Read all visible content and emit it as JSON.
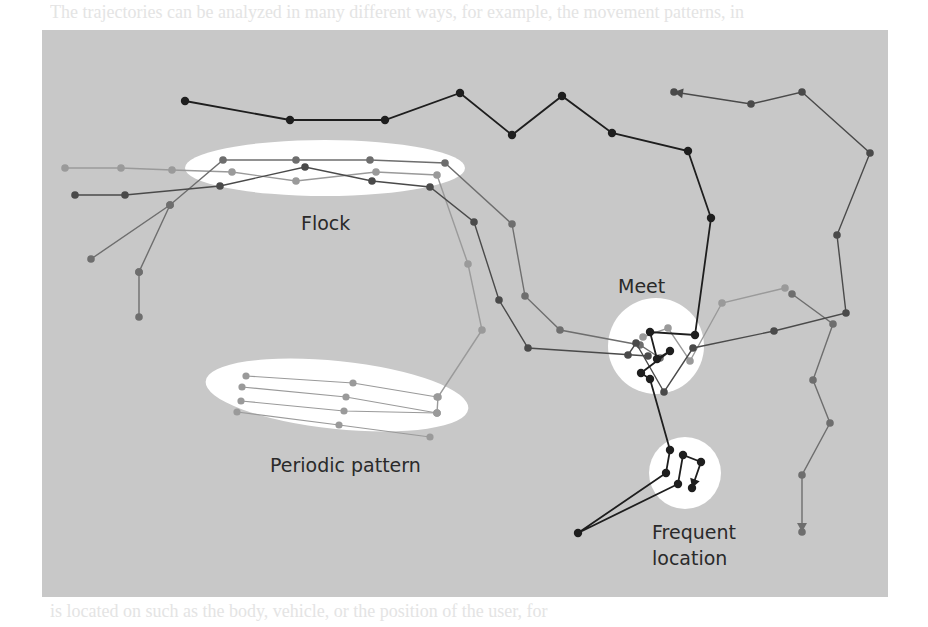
{
  "figure": {
    "panel_bg": "#c8c8c8",
    "highlight_color": "#ffffff",
    "colors": {
      "black": "#1e1e1e",
      "dark": "#4a4a4a",
      "mid": "#6e6e6e",
      "light": "#9a9a9a"
    }
  },
  "labels": {
    "flock": "Flock",
    "meet": "Meet",
    "periodic": "Periodic pattern",
    "frequent_line1": "Frequent",
    "frequent_line2": "location"
  },
  "bleed_text": {
    "top": "The trajectories can be analyzed in many different ways, for example, the movement patterns, in",
    "bottom": "is located on such as the body, vehicle, or the position of the user, for"
  },
  "regions": [
    {
      "name": "flock",
      "shape": "ellipse",
      "cx": 325,
      "cy": 168,
      "rx": 140,
      "ry": 28
    },
    {
      "name": "periodic",
      "shape": "ellipse",
      "cx": 337,
      "cy": 395,
      "rx": 132,
      "ry": 34,
      "rotate": 6
    },
    {
      "name": "meet",
      "shape": "circle",
      "cx": 656,
      "cy": 346,
      "r": 48
    },
    {
      "name": "frequent",
      "shape": "circle",
      "cx": 685,
      "cy": 473,
      "r": 36
    }
  ],
  "trajectories": [
    {
      "id": "black-top",
      "color": "black",
      "points": [
        [
          185,
          101
        ],
        [
          290,
          120
        ],
        [
          385,
          120
        ],
        [
          460,
          93
        ],
        [
          512,
          135
        ],
        [
          562,
          96
        ],
        [
          612,
          133
        ],
        [
          688,
          151
        ],
        [
          711,
          218
        ],
        [
          695,
          335
        ],
        [
          650,
          332
        ],
        [
          657,
          359
        ],
        [
          670,
          351
        ],
        [
          641,
          373
        ],
        [
          650,
          379
        ],
        [
          670,
          450
        ],
        [
          666,
          473
        ],
        [
          578,
          533
        ],
        [
          678,
          484
        ],
        [
          683,
          455
        ],
        [
          701,
          462
        ],
        [
          692,
          488
        ]
      ],
      "arrow_end": true
    },
    {
      "id": "gray-right-loop",
      "color": "dark",
      "points": [
        [
          674,
          92
        ],
        [
          751,
          104
        ],
        [
          802,
          92
        ],
        [
          870,
          153
        ],
        [
          837,
          235
        ],
        [
          846,
          313
        ],
        [
          774,
          331
        ],
        [
          693,
          348
        ],
        [
          664,
          392
        ],
        [
          636,
          343
        ],
        [
          628,
          355
        ]
      ],
      "arrow_start": true
    },
    {
      "id": "flock-dark",
      "color": "dark",
      "points": [
        [
          75,
          195
        ],
        [
          125,
          195
        ],
        [
          220,
          186
        ],
        [
          305,
          167
        ],
        [
          372,
          181
        ],
        [
          430,
          187
        ],
        [
          474,
          222
        ],
        [
          499,
          300
        ],
        [
          528,
          348
        ],
        [
          648,
          356
        ]
      ]
    },
    {
      "id": "flock-mid",
      "color": "mid",
      "points": [
        [
          91,
          259
        ],
        [
          170,
          205
        ],
        [
          223,
          160
        ],
        [
          296,
          160
        ],
        [
          370,
          160
        ],
        [
          445,
          163
        ],
        [
          512,
          224
        ],
        [
          525,
          296
        ],
        [
          560,
          330
        ],
        [
          640,
          345
        ],
        [
          660,
          358
        ]
      ]
    },
    {
      "id": "flock-light",
      "color": "light",
      "points": [
        [
          65,
          168
        ],
        [
          121,
          168
        ],
        [
          172,
          170
        ],
        [
          232,
          172
        ],
        [
          296,
          181
        ],
        [
          376,
          172
        ],
        [
          437,
          175
        ],
        [
          468,
          264
        ],
        [
          482,
          330
        ],
        [
          438,
          397
        ],
        [
          437,
          413
        ]
      ]
    },
    {
      "id": "left-tail",
      "color": "mid",
      "points": [
        [
          139,
          272
        ],
        [
          139,
          317
        ],
        [
          139,
          272
        ],
        [
          170,
          205
        ]
      ]
    },
    {
      "id": "right-down",
      "color": "mid",
      "points": [
        [
          792,
          294
        ],
        [
          833,
          324
        ],
        [
          813,
          380
        ],
        [
          830,
          423
        ],
        [
          802,
          475
        ],
        [
          802,
          532
        ]
      ],
      "arrow_end": true
    },
    {
      "id": "meet-zig",
      "color": "light",
      "points": [
        [
          643,
          337
        ],
        [
          668,
          328
        ],
        [
          690,
          361
        ],
        [
          722,
          303
        ],
        [
          785,
          288
        ]
      ]
    },
    {
      "id": "periodic-rows",
      "color": "light",
      "rows": [
        [
          [
            246,
            376
          ],
          [
            353,
            383
          ],
          [
            437,
            397
          ]
        ],
        [
          [
            242,
            387
          ],
          [
            346,
            397
          ],
          [
            437,
            413
          ]
        ],
        [
          [
            241,
            401
          ],
          [
            344,
            411
          ],
          [
            437,
            413
          ]
        ],
        [
          [
            237,
            412
          ],
          [
            339,
            425
          ],
          [
            430,
            437
          ]
        ]
      ]
    }
  ]
}
